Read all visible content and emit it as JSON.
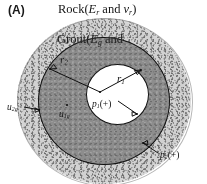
{
  "figure": {
    "panel_label": "(A)",
    "type": "cross-section-diagram"
  },
  "regions": [
    {
      "id": "rock",
      "name": "Rock",
      "fill_color": "#cfcfcf",
      "texture": "speckled"
    },
    {
      "id": "grout",
      "name": "Grout",
      "fill_color": "#8d8d8d",
      "texture": "speckled-dark"
    },
    {
      "id": "hole",
      "name": "Borehole",
      "fill_color": "#fdfdfd",
      "texture": "plain"
    }
  ],
  "labels": {
    "rock": {
      "text": "Rock(",
      "sym1": "E",
      "sub1": "r",
      "mid": " and ",
      "sym2": "v",
      "sub2": "r",
      "close": ")"
    },
    "grout": {
      "text": "Grout(",
      "sym1": "E",
      "sub1": "g",
      "mid": " and",
      "sym2": "",
      "sub2": "",
      "close": ""
    },
    "r1": {
      "sym": "r",
      "sub": "1"
    },
    "r2": {
      "sym": "r",
      "sub": "2"
    },
    "p1": {
      "sym": "p",
      "sub": "1",
      "sign": "(+)"
    },
    "p2": {
      "sym": "p",
      "sub": "2",
      "sign": "(+)"
    },
    "u1g": {
      "sym": "u",
      "sub": "1g"
    },
    "u2g": {
      "sym": "u",
      "sub": "2g"
    }
  },
  "colors": {
    "outline": "#141414",
    "rock_fill": "#cfcfcf",
    "grout_fill": "#8d8d8d",
    "hole_fill": "#fdfdfd",
    "text": "#161616"
  }
}
